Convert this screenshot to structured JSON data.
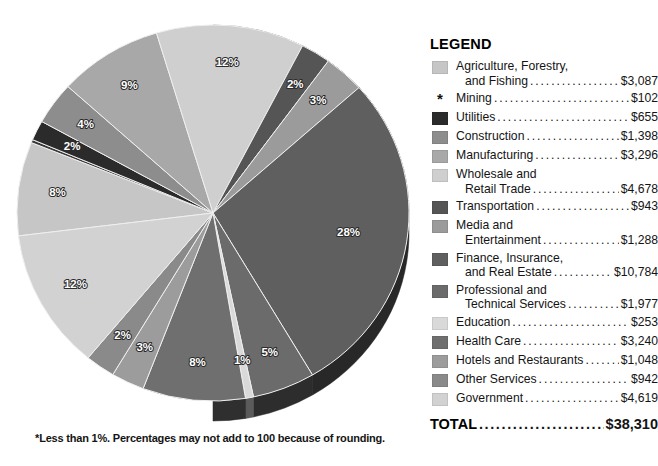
{
  "chart_data": {
    "type": "pie",
    "title": "",
    "units": "millions of dollars",
    "total_label": "TOTAL",
    "total_value": "$38,310",
    "footnote": "*Less than 1%. Percentages may not add to 100 because of rounding.",
    "legend_title": "LEGEND",
    "legend_position": "right",
    "categories": [
      "Agriculture, Forestry, and Fishing",
      "Mining",
      "Utilities",
      "Construction",
      "Manufacturing",
      "Wholesale and Retail Trade",
      "Transportation",
      "Media and Entertainment",
      "Finance, Insurance, and Real Estate",
      "Professional and Technical Services",
      "Education",
      "Health Care",
      "Hotels and Restaurants",
      "Other Services",
      "Government"
    ],
    "values": [
      3087,
      102,
      655,
      1398,
      3296,
      4678,
      943,
      1288,
      10784,
      1977,
      253,
      3240,
      1048,
      942,
      4619
    ],
    "percent_labels": [
      "8%",
      "*",
      "2%",
      "4%",
      "9%",
      "12%",
      "2%",
      "3%",
      "28%",
      "5%",
      "1%",
      "8%",
      "3%",
      "2%",
      "12%"
    ],
    "colors": [
      "#c6c6c6",
      "#3a3a3a",
      "#2b2b2b",
      "#8d8d8d",
      "#a8a8a8",
      "#cfcfcf",
      "#555555",
      "#9b9b9b",
      "#5f5f5f",
      "#6b6b6b",
      "#d9d9d9",
      "#6f6f6f",
      "#9c9c9c",
      "#8a8a8a",
      "#d2d2d2"
    ]
  },
  "legend": {
    "title": "LEGEND",
    "rows": [
      {
        "line1": "Agriculture, Forestry,",
        "line2": "and Fishing",
        "amount": "$3,087",
        "marker": "swatch",
        "color": "#c6c6c6"
      },
      {
        "line1": "",
        "line2": "Mining",
        "amount": "$102",
        "marker": "asterisk",
        "symbol": "*",
        "color": "#3a3a3a"
      },
      {
        "line1": "",
        "line2": "Utilities",
        "amount": "$655",
        "marker": "swatch",
        "color": "#2b2b2b"
      },
      {
        "line1": "",
        "line2": "Construction",
        "amount": "$1,398",
        "marker": "swatch",
        "color": "#8d8d8d"
      },
      {
        "line1": "",
        "line2": "Manufacturing",
        "amount": "$3,296",
        "marker": "swatch",
        "color": "#a8a8a8"
      },
      {
        "line1": "Wholesale and",
        "line2": "Retail Trade",
        "amount": "$4,678",
        "marker": "swatch",
        "color": "#cfcfcf"
      },
      {
        "line1": "",
        "line2": "Transportation",
        "amount": "$943",
        "marker": "swatch",
        "color": "#555555"
      },
      {
        "line1": "Media and",
        "line2": "Entertainment",
        "amount": "$1,288",
        "marker": "swatch",
        "color": "#9b9b9b"
      },
      {
        "line1": "Finance, Insurance,",
        "line2": "and Real Estate",
        "amount": "$10,784",
        "marker": "swatch",
        "color": "#5f5f5f"
      },
      {
        "line1": "Professional and",
        "line2": "Technical Services",
        "amount": "$1,977",
        "marker": "swatch",
        "color": "#6b6b6b"
      },
      {
        "line1": "",
        "line2": "Education",
        "amount": "$253",
        "marker": "swatch",
        "color": "#d9d9d9"
      },
      {
        "line1": "",
        "line2": "Health Care",
        "amount": "$3,240",
        "marker": "swatch",
        "color": "#6f6f6f"
      },
      {
        "line1": "",
        "line2": "Hotels and Restaurants",
        "amount": "$1,048",
        "marker": "swatch",
        "color": "#9c9c9c"
      },
      {
        "line1": "",
        "line2": "Other Services",
        "amount": "$942",
        "marker": "swatch",
        "color": "#8a8a8a"
      },
      {
        "line1": "",
        "line2": "Government",
        "amount": "$4,619",
        "marker": "swatch",
        "color": "#d2d2d2"
      }
    ],
    "total_label": "TOTAL",
    "total_amount": "$38,310"
  },
  "footnote": "*Less than 1%. Percentages may not add to 100 because of rounding."
}
